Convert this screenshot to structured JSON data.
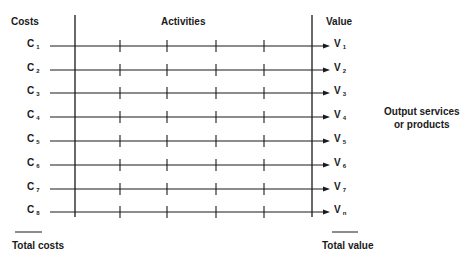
{
  "headers": {
    "costs": "Costs",
    "activities": "Activities",
    "value": "Value"
  },
  "rows": [
    {
      "cost": "C",
      "cost_sub": "1",
      "value": "V",
      "value_sub": "1"
    },
    {
      "cost": "C",
      "cost_sub": "2",
      "value": "V",
      "value_sub": "2"
    },
    {
      "cost": "C",
      "cost_sub": "3",
      "value": "V",
      "value_sub": "3"
    },
    {
      "cost": "C",
      "cost_sub": "4",
      "value": "V",
      "value_sub": "4"
    },
    {
      "cost": "C",
      "cost_sub": "5",
      "value": "V",
      "value_sub": "5"
    },
    {
      "cost": "C",
      "cost_sub": "6",
      "value": "V",
      "value_sub": "6"
    },
    {
      "cost": "C",
      "cost_sub": "7",
      "value": "V",
      "value_sub": "7"
    },
    {
      "cost": "C",
      "cost_sub": "8",
      "value": "V",
      "value_sub": "n"
    }
  ],
  "side_note": {
    "line1": "Output services",
    "line2": "or products"
  },
  "footer": {
    "total_costs": "Total costs",
    "total_value": "Total value"
  },
  "colors": {
    "ink": "#1a1a1a",
    "background": "#ffffff"
  }
}
